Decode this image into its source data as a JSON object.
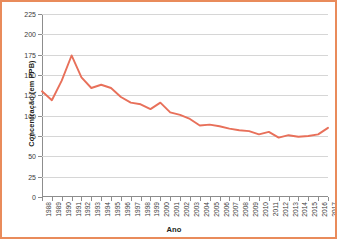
{
  "figure": {
    "border_color": "#E98B5B",
    "background": "#ffffff"
  },
  "chart_data": {
    "type": "line",
    "title": "",
    "xlabel": "Ano",
    "ylabel": "Concentração (em PPB)",
    "ylim": [
      0,
      225
    ],
    "yticks": [
      0,
      25,
      50,
      75,
      100,
      125,
      150,
      175,
      200,
      225
    ],
    "grid": true,
    "legend": false,
    "line_color": "#E8705A",
    "categories": [
      "1988",
      "1989",
      "1990",
      "1991",
      "1992",
      "1993",
      "1994",
      "1995",
      "1996",
      "1997",
      "1998",
      "1999",
      "2000",
      "2001",
      "2002",
      "2003",
      "2004",
      "2005",
      "2006",
      "2007",
      "2008",
      "2009",
      "2010",
      "2011",
      "2012",
      "2013",
      "2014",
      "2015",
      "2016",
      "2017"
    ],
    "values": [
      130,
      119,
      143,
      174,
      147,
      134,
      138,
      134,
      123,
      116,
      114,
      108,
      116,
      104,
      101,
      96,
      88,
      89,
      87,
      84,
      82,
      81,
      77,
      80,
      73,
      76,
      74,
      75,
      77,
      85
    ],
    "series": [
      {
        "name": "Concentração (em PPB)",
        "values": [
          130,
          119,
          143,
          174,
          147,
          134,
          138,
          134,
          123,
          116,
          114,
          108,
          116,
          104,
          101,
          96,
          88,
          89,
          87,
          84,
          82,
          81,
          77,
          80,
          73,
          76,
          74,
          75,
          77,
          85
        ]
      }
    ]
  }
}
